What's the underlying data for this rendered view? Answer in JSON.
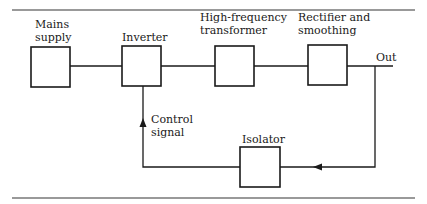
{
  "diagram": {
    "type": "block-diagram",
    "colors": {
      "line": "#1a1a1a",
      "rule": "#777777",
      "background": "#ffffff"
    },
    "blocks": [
      {
        "id": "mains",
        "label_lines": [
          "Mains",
          "supply"
        ]
      },
      {
        "id": "inverter",
        "label_lines": [
          "Inverter"
        ]
      },
      {
        "id": "hf_transformer",
        "label_lines": [
          "High-frequency",
          "transformer"
        ]
      },
      {
        "id": "rectifier",
        "label_lines": [
          "Rectifier and",
          "smoothing"
        ]
      },
      {
        "id": "isolator",
        "label_lines": [
          "Isolator"
        ]
      }
    ],
    "output_label": "Out",
    "feedback_label_lines": [
      "Control",
      "signal"
    ],
    "connections": [
      {
        "from": "mains",
        "to": "inverter"
      },
      {
        "from": "inverter",
        "to": "hf_transformer"
      },
      {
        "from": "hf_transformer",
        "to": "rectifier"
      },
      {
        "from": "rectifier",
        "to": "out"
      },
      {
        "from": "out",
        "to": "isolator",
        "arrow": "left"
      },
      {
        "from": "isolator",
        "to": "inverter",
        "arrow": "up",
        "label": "Control signal"
      }
    ]
  }
}
